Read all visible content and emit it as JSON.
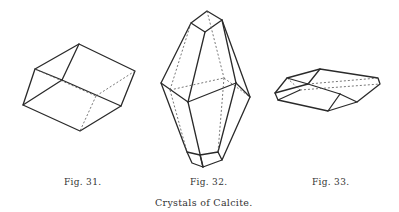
{
  "figures": [
    {
      "id": "fig-31",
      "label": "Fig. 31.",
      "shape": "rhombohedron"
    },
    {
      "id": "fig-32",
      "label": "Fig. 32.",
      "shape": "scalenohedron-prism"
    },
    {
      "id": "fig-33",
      "label": "Fig. 33.",
      "shape": "flat-rhombohedron"
    }
  ],
  "title": "Crystals of Calcite.",
  "colors": {
    "line": "#2a2a2a",
    "background": "#ffffff",
    "text": "#333333"
  }
}
